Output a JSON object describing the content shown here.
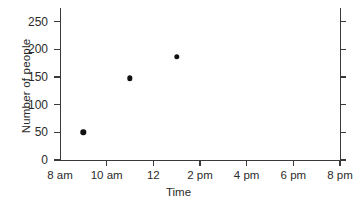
{
  "chart_data": {
    "type": "scatter",
    "title": "",
    "xlabel": "Time",
    "ylabel": "Number of people",
    "grid": false,
    "legend": "none",
    "xlim": [
      8,
      20
    ],
    "ylim": [
      0,
      275
    ],
    "x_tick_labels": [
      "8 am",
      "10 am",
      "12",
      "2 pm",
      "4 pm",
      "6 pm",
      "8 pm"
    ],
    "x_tick_values": [
      8,
      10,
      12,
      14,
      16,
      18,
      20
    ],
    "y_tick_labels": [
      "0",
      "50",
      "100",
      "150",
      "200",
      "250"
    ],
    "y_tick_values": [
      0,
      50,
      100,
      150,
      200,
      250
    ],
    "points": [
      {
        "x_label": "9 am",
        "x": 9,
        "y": 50
      },
      {
        "x_label": "11 am",
        "x": 11,
        "y": 148
      },
      {
        "x_label": "1 pm",
        "x": 13,
        "y": 187
      }
    ],
    "marker": "filled-circle",
    "marker_color": "#111111",
    "axis_color": "#3a3a3a",
    "background_color": "#ffffff"
  }
}
